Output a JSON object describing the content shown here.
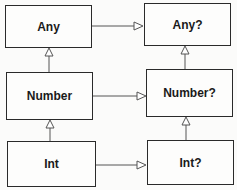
{
  "diagram": {
    "nodes": {
      "any": "Any",
      "any_nullable": "Any?",
      "number": "Number",
      "number_nullable": "Number?",
      "int": "Int",
      "int_nullable": "Int?"
    },
    "edges": [
      {
        "from": "Number",
        "to": "Any",
        "type": "inheritance"
      },
      {
        "from": "Int",
        "to": "Number",
        "type": "inheritance"
      },
      {
        "from": "Number?",
        "to": "Any?",
        "type": "inheritance"
      },
      {
        "from": "Int?",
        "to": "Number?",
        "type": "inheritance"
      },
      {
        "from": "Any",
        "to": "Any?",
        "type": "inheritance"
      },
      {
        "from": "Number",
        "to": "Number?",
        "type": "inheritance"
      },
      {
        "from": "Int",
        "to": "Int?",
        "type": "inheritance"
      }
    ],
    "caption": ""
  }
}
